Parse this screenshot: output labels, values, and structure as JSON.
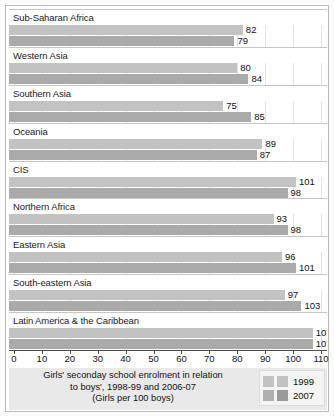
{
  "chart_data": {
    "type": "bar",
    "orientation": "horizontal",
    "title": "",
    "caption_lines": [
      "Girls' seconday school enrolment in relation",
      "to boys', 1998-99 and 2006-07",
      "(Girls per 100 boys)"
    ],
    "xlabel": "",
    "ylabel": "",
    "xlim": [
      0,
      110
    ],
    "xticks": [
      0,
      10,
      20,
      30,
      40,
      50,
      60,
      70,
      80,
      90,
      100,
      110
    ],
    "grid": true,
    "legend_position": "bottom-right",
    "categories": [
      "Sub-Saharan Africa",
      "Western Asia",
      "Southern Asia",
      "Oceania",
      "CIS",
      "Northern Africa",
      "Eastern Asia",
      "South-eastern Asia",
      "Latin America & the Caribbean",
      "Developed regions",
      "Developing regions"
    ],
    "series": [
      {
        "name": "1999",
        "color": "#c2c2c2",
        "values": [
          82,
          80,
          75,
          89,
          101,
          93,
          96,
          97,
          107,
          100,
          89
        ]
      },
      {
        "name": "2007",
        "color": "#aaaaaa",
        "values": [
          79,
          84,
          85,
          87,
          98,
          98,
          101,
          103,
          107,
          100,
          94
        ]
      }
    ]
  },
  "legend": {
    "items": [
      {
        "label": "1999"
      },
      {
        "label": "2007"
      }
    ]
  }
}
